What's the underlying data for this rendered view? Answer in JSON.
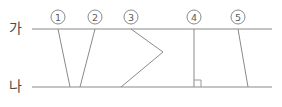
{
  "figure": {
    "type": "geometry-diagram",
    "width": 282,
    "height": 107,
    "background_color": "#ffffff",
    "line_color": "#8a8a8a",
    "marker_text_color": "#5a5a5a",
    "label_color": "#4a4a4a",
    "rails": [
      {
        "id": "rail-top",
        "label": "가",
        "label_x": 9,
        "label_y": 21,
        "y": 29,
        "x_start": 32,
        "x_end": 272
      },
      {
        "id": "rail-bottom",
        "label": "나",
        "label_x": 9,
        "label_y": 79,
        "y": 87,
        "x_start": 32,
        "x_end": 272
      }
    ],
    "markers": [
      {
        "id": "marker-1",
        "label": "①",
        "text": "1",
        "cx": 58,
        "cy": 17,
        "r": 7
      },
      {
        "id": "marker-2",
        "label": "②",
        "text": "2",
        "cx": 95,
        "cy": 17,
        "r": 7
      },
      {
        "id": "marker-3",
        "label": "③",
        "text": "3",
        "cx": 131,
        "cy": 17,
        "r": 7
      },
      {
        "id": "marker-4",
        "label": "④",
        "text": "4",
        "cx": 194,
        "cy": 17,
        "r": 7
      },
      {
        "id": "marker-5",
        "label": "⑤",
        "text": "5",
        "cx": 238,
        "cy": 17,
        "r": 7
      }
    ],
    "transversals": [
      {
        "id": "transversal-1",
        "marker": "①",
        "shape": "straight",
        "points": "58,29 70,87"
      },
      {
        "id": "transversal-2",
        "marker": "②",
        "shape": "straight",
        "points": "95,29 80,87"
      },
      {
        "id": "transversal-3",
        "marker": "③",
        "shape": "bent",
        "points": "131,29 163,52 121,87"
      },
      {
        "id": "transversal-4",
        "marker": "④",
        "shape": "vertical",
        "points": "194,29 194,87",
        "right_angle": true
      },
      {
        "id": "transversal-5",
        "marker": "⑤",
        "shape": "straight",
        "points": "238,29 248,87"
      }
    ],
    "angle_mark": {
      "id": "right-angle-mark",
      "at_transversal": "④",
      "points": "194,80 201,80 201,87",
      "size": 7
    }
  }
}
